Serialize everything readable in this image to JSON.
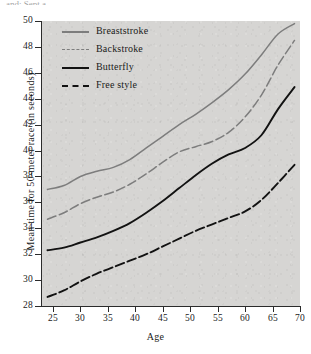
{
  "figure": {
    "top_clipped_text": "and: Sept a",
    "background_color": "#ffffff",
    "panel_color": "#d6d5d3"
  },
  "chart_data": {
    "type": "line",
    "title": "",
    "xlabel": "Age",
    "ylabel": "Mean time for 50-meter race (in seconds)",
    "xlim": [
      23,
      70
    ],
    "ylim": [
      28,
      50
    ],
    "xticks": [
      25,
      30,
      35,
      40,
      45,
      50,
      55,
      60,
      65,
      70
    ],
    "yticks": [
      28,
      30,
      32,
      34,
      36,
      38,
      40,
      42,
      44,
      46,
      48,
      50
    ],
    "grid": false,
    "legend_position": "upper left",
    "x": [
      24,
      27,
      30,
      33,
      36,
      39,
      42,
      45,
      48,
      51,
      54,
      57,
      60,
      63,
      66,
      69
    ],
    "series": [
      {
        "name": "Breaststroke",
        "color": "#7d7d7d",
        "style": "solid",
        "values": [
          37.0,
          37.3,
          38.0,
          38.4,
          38.7,
          39.3,
          40.2,
          41.1,
          42.0,
          42.8,
          43.7,
          44.7,
          45.9,
          47.4,
          49.0,
          49.8
        ]
      },
      {
        "name": "Backstroke",
        "color": "#7d7d7d",
        "style": "dashed",
        "values": [
          34.7,
          35.2,
          35.9,
          36.4,
          36.8,
          37.4,
          38.2,
          39.1,
          39.9,
          40.3,
          40.7,
          41.4,
          42.6,
          44.3,
          46.6,
          48.5
        ]
      },
      {
        "name": "Butterfly",
        "color": "#121212",
        "style": "solid",
        "values": [
          32.3,
          32.5,
          32.9,
          33.3,
          33.8,
          34.4,
          35.2,
          36.1,
          37.1,
          38.1,
          39.0,
          39.7,
          40.2,
          41.2,
          43.2,
          44.9
        ]
      },
      {
        "name": "Free style",
        "color": "#121212",
        "style": "dashed",
        "values": [
          28.7,
          29.2,
          29.9,
          30.5,
          31.0,
          31.5,
          32.0,
          32.6,
          33.2,
          33.8,
          34.3,
          34.8,
          35.3,
          36.2,
          37.5,
          38.9
        ]
      }
    ]
  }
}
